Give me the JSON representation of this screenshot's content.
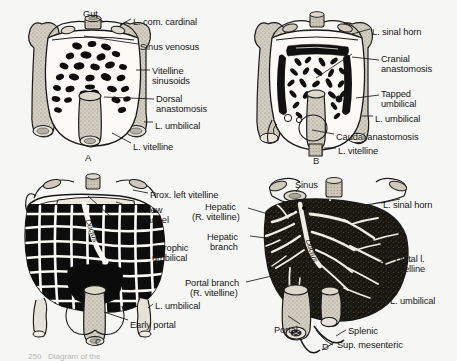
{
  "figure": {
    "background_color": "#f6f6f4",
    "ink_color": "#161616",
    "vessel_fill": "#cfcabd",
    "sinusoid_fill": "#101010"
  },
  "panels": [
    {
      "id": "A",
      "letter": "A",
      "letter_pos": {
        "x": 85,
        "y": 152
      },
      "description": "Early vitelline plexus with scattered sinusoids"
    },
    {
      "id": "B",
      "letter": "B",
      "letter_pos": {
        "x": 313,
        "y": 155
      },
      "description": "Cranial and caudal anastomoses forming"
    },
    {
      "id": "C",
      "letter": "C",
      "letter_pos": {
        "x": 95,
        "y": 336
      },
      "description": "Reticulated hepatic network with new channel"
    },
    {
      "id": "D",
      "letter": "D",
      "letter_pos": {
        "x": 322,
        "y": 341
      },
      "description": "Mature liver mass with portal, splenic and mesenteric veins"
    }
  ],
  "labels": {
    "panel_a": [
      {
        "text": "Gut",
        "x": 83,
        "y": 9,
        "align": "left"
      },
      {
        "text": "L. com. cardinal",
        "x": 133,
        "y": 17,
        "align": "left"
      },
      {
        "text": "Sinus venosus",
        "x": 140,
        "y": 42,
        "align": "left"
      },
      {
        "text": "Vitelline",
        "x": 152,
        "y": 66,
        "align": "left"
      },
      {
        "text": "sinusoids",
        "x": 152,
        "y": 76,
        "align": "left"
      },
      {
        "text": "Dorsal",
        "x": 156,
        "y": 94,
        "align": "left"
      },
      {
        "text": "anastomosis",
        "x": 156,
        "y": 104,
        "align": "left"
      },
      {
        "text": "L. umbilical",
        "x": 155,
        "y": 121,
        "align": "left"
      },
      {
        "text": "L. vitelline",
        "x": 133,
        "y": 142,
        "align": "left"
      }
    ],
    "panel_b": [
      {
        "text": "L. sinal horn",
        "x": 372,
        "y": 27,
        "align": "left"
      },
      {
        "text": "Cranial",
        "x": 381,
        "y": 54,
        "align": "left"
      },
      {
        "text": "anastomosis",
        "x": 381,
        "y": 64,
        "align": "left"
      },
      {
        "text": "Tapped",
        "x": 381,
        "y": 89,
        "align": "left"
      },
      {
        "text": "umbilical",
        "x": 381,
        "y": 99,
        "align": "left"
      },
      {
        "text": "L. umbilical",
        "x": 375,
        "y": 114,
        "align": "left"
      },
      {
        "text": "Caudal anastomosis",
        "x": 336,
        "y": 132,
        "align": "left"
      },
      {
        "text": "L. vitelline",
        "x": 338,
        "y": 146,
        "align": "left"
      }
    ],
    "panel_c": [
      {
        "text": "Prox. left vitelline",
        "x": 150,
        "y": 190,
        "align": "left"
      },
      {
        "text": "New",
        "x": 144,
        "y": 205,
        "align": "left"
      },
      {
        "text": "channel",
        "x": 137,
        "y": 215,
        "align": "left"
      },
      {
        "text": "Atrophic",
        "x": 155,
        "y": 243,
        "align": "left"
      },
      {
        "text": "umbilical",
        "x": 152,
        "y": 253,
        "align": "left"
      },
      {
        "text": "L. umbilical",
        "x": 155,
        "y": 301,
        "align": "left"
      },
      {
        "text": "Early portal",
        "x": 130,
        "y": 320,
        "align": "left"
      }
    ],
    "panel_d": [
      {
        "text": "Sinus",
        "x": 295,
        "y": 180,
        "align": "left"
      },
      {
        "text": "Hepatic",
        "x": 205,
        "y": 202,
        "align": "left"
      },
      {
        "text": "(R. vitelline)",
        "x": 192,
        "y": 212,
        "align": "left"
      },
      {
        "text": "L. sinal horn",
        "x": 383,
        "y": 200,
        "align": "left"
      },
      {
        "text": "Hepatic",
        "x": 207,
        "y": 232,
        "align": "left"
      },
      {
        "text": "branch",
        "x": 210,
        "y": 242,
        "align": "left"
      },
      {
        "text": "Distal l.",
        "x": 395,
        "y": 254,
        "align": "left"
      },
      {
        "text": "vitelline",
        "x": 395,
        "y": 264,
        "align": "left"
      },
      {
        "text": "Portal branch",
        "x": 185,
        "y": 278,
        "align": "left"
      },
      {
        "text": "(R. vitelline)",
        "x": 190,
        "y": 288,
        "align": "left"
      },
      {
        "text": "L. umbilical",
        "x": 390,
        "y": 296,
        "align": "left"
      },
      {
        "text": "Portal",
        "x": 274,
        "y": 325,
        "align": "left"
      },
      {
        "text": "Splenic",
        "x": 348,
        "y": 326,
        "align": "left"
      },
      {
        "text": "Sup. mesenteric",
        "x": 337,
        "y": 340,
        "align": "left"
      }
    ]
  },
  "inline_text": [
    {
      "text": "Ductus",
      "panel": "C",
      "x": 92,
      "y": 218
    },
    {
      "text": "Ductus",
      "panel": "D",
      "x": 312,
      "y": 238
    }
  ],
  "caption": {
    "text": "250   Diagram of the",
    "x": 28,
    "y": 352
  }
}
